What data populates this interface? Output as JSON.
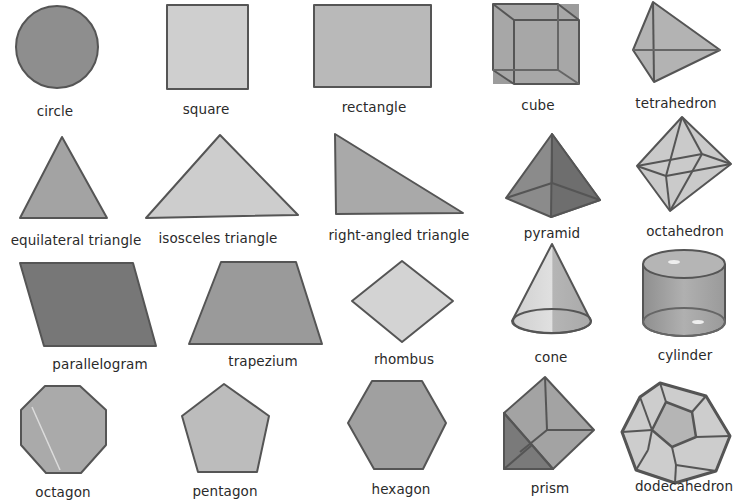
{
  "colors": {
    "fill_dark": "#7d7d7d",
    "fill_mid": "#a8a8a8",
    "fill_light": "#c9c9c9",
    "fill_lighter": "#d6d6d6",
    "stroke": "#555555",
    "text": "#2a2a2a"
  },
  "shapes": [
    {
      "id": "circle",
      "label": "circle",
      "dimension": "2D"
    },
    {
      "id": "square",
      "label": "square",
      "dimension": "2D"
    },
    {
      "id": "rectangle",
      "label": "rectangle",
      "dimension": "2D"
    },
    {
      "id": "cube",
      "label": "cube",
      "dimension": "3D"
    },
    {
      "id": "tetrahedron",
      "label": "tetrahedron",
      "dimension": "3D"
    },
    {
      "id": "equilateral-triangle",
      "label": "equilateral triangle",
      "dimension": "2D"
    },
    {
      "id": "isosceles-triangle",
      "label": "isosceles triangle",
      "dimension": "2D"
    },
    {
      "id": "right-angled-triangle",
      "label": "right-angled triangle",
      "dimension": "2D"
    },
    {
      "id": "pyramid",
      "label": "pyramid",
      "dimension": "3D"
    },
    {
      "id": "octahedron",
      "label": "octahedron",
      "dimension": "3D"
    },
    {
      "id": "parallelogram",
      "label": "parallelogram",
      "dimension": "2D"
    },
    {
      "id": "trapezium",
      "label": "trapezium",
      "dimension": "2D"
    },
    {
      "id": "rhombus",
      "label": "rhombus",
      "dimension": "2D"
    },
    {
      "id": "cone",
      "label": "cone",
      "dimension": "3D"
    },
    {
      "id": "cylinder",
      "label": "cylinder",
      "dimension": "3D"
    },
    {
      "id": "octagon",
      "label": "octagon",
      "dimension": "2D"
    },
    {
      "id": "pentagon",
      "label": "pentagon",
      "dimension": "2D"
    },
    {
      "id": "hexagon",
      "label": "hexagon",
      "dimension": "2D"
    },
    {
      "id": "prism",
      "label": "prism",
      "dimension": "3D"
    },
    {
      "id": "dodecahedron",
      "label": "dodecahedron",
      "dimension": "3D"
    }
  ]
}
